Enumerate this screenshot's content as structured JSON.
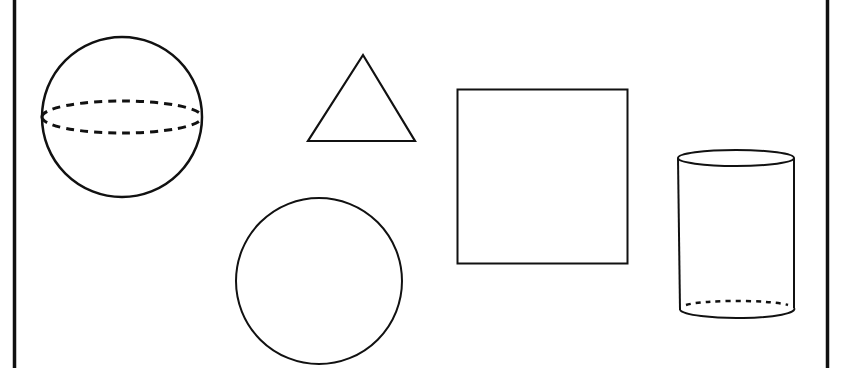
{
  "diagram": {
    "title": "",
    "stroke_color": "#111111",
    "background_color": "#ffffff",
    "shapes": [
      {
        "name": "sphere",
        "type": "3d",
        "cx": 122,
        "cy": 117,
        "r": 80
      },
      {
        "name": "triangle",
        "type": "2d",
        "points": [
          [
            363,
            55
          ],
          [
            308,
            141
          ],
          [
            415,
            141
          ]
        ]
      },
      {
        "name": "square",
        "type": "2d",
        "x": 457,
        "y": 89,
        "w": 170,
        "h": 174
      },
      {
        "name": "circle",
        "type": "2d",
        "cx": 319,
        "cy": 281,
        "r": 83
      },
      {
        "name": "cylinder",
        "type": "3d",
        "x": 678,
        "y": 158,
        "w": 116,
        "h": 150
      }
    ]
  }
}
